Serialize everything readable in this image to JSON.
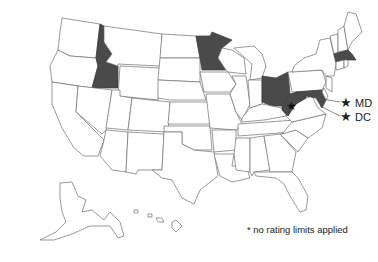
{
  "map": {
    "title": "",
    "shade_color": "#4a4a4a",
    "shaded_states": [
      "Idaho",
      "Minnesota",
      "Ohio",
      "West Virginia",
      "Maryland",
      "Massachusetts"
    ],
    "starred_states": [
      "West Virginia",
      "Maryland",
      "District of Columbia"
    ],
    "insets": [
      "Alaska",
      "Hawaii"
    ]
  },
  "callouts": [
    {
      "symbol": "★",
      "label": "MD"
    },
    {
      "symbol": "★",
      "label": "DC"
    }
  ],
  "wv_star": "★",
  "footnote": "* no rating limits applied"
}
